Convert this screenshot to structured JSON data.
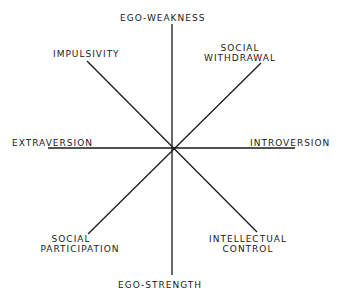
{
  "diagram": {
    "type": "radial-axes",
    "center": {
      "x": 172,
      "y": 148
    },
    "line_color": "#1a1a1a",
    "axes": [
      {
        "name": "ego-axis",
        "x1": 172,
        "y1": 24,
        "x2": 172,
        "y2": 275
      },
      {
        "name": "extraversion-axis",
        "x1": 48,
        "y1": 148,
        "x2": 295,
        "y2": 148
      },
      {
        "name": "impulsivity-axis",
        "x1": 87,
        "y1": 61,
        "x2": 257,
        "y2": 232
      },
      {
        "name": "withdrawal-axis",
        "x1": 261,
        "y1": 63,
        "x2": 88,
        "y2": 234
      }
    ],
    "labels": {
      "ego_weakness": "EGO-WEAKNESS",
      "ego_strength": "EGO-STRENGTH",
      "extraversion": "EXTRAVERSION",
      "introversion": "INTROVERSION",
      "impulsivity": "IMPULSIVITY",
      "social_withdrawal_1": "SOCIAL",
      "social_withdrawal_2": "WITHDRAWAL",
      "social_participation_1": "SOCIAL",
      "social_participation_2": "PARTICIPATION",
      "intellectual_control_1": "INTELLECTUAL",
      "intellectual_control_2": "CONTROL"
    }
  }
}
